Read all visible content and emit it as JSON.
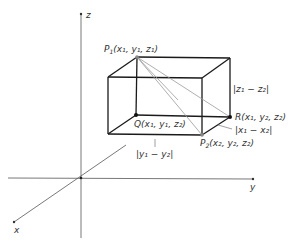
{
  "diagram": {
    "axes": {
      "x_label": "x",
      "y_label": "y",
      "z_label": "z"
    },
    "points": {
      "P1": {
        "name": "P",
        "sub": "1",
        "coords": "(x₁, y₁, z₁)"
      },
      "P2": {
        "name": "P",
        "sub": "2",
        "coords": "(x₂, y₂, z₂)"
      },
      "Q": {
        "name": "Q",
        "coords": "(x₁, y₁, z₂)"
      },
      "R": {
        "name": "R",
        "coords": "(x₁, y₂, z₂)"
      }
    },
    "distances": {
      "z_diff": "|z₁ − z₂|",
      "x_diff": "|x₁ − x₂|",
      "y_diff": "|y₁ − y₂|"
    },
    "colors": {
      "edge": "#1a1a1a",
      "axis": "#555555",
      "diagonal": "#9a9a9a"
    }
  }
}
